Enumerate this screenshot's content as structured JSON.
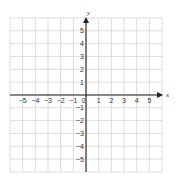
{
  "chart_data": {
    "type": "scatter",
    "title": "",
    "xlabel": "x",
    "ylabel": "y",
    "xlim": [
      -6,
      6
    ],
    "ylim": [
      -6,
      6
    ],
    "grid": true,
    "x_ticks": [
      -5,
      -4,
      -3,
      -2,
      -1,
      0,
      1,
      2,
      3,
      4,
      5
    ],
    "x_tick_labels": [
      "−5",
      "−4",
      "−3",
      "−2",
      "−1",
      "0",
      "1",
      "2",
      "3",
      "4",
      "5"
    ],
    "y_ticks": [
      5,
      4,
      3,
      2,
      1,
      -1,
      -2,
      -3,
      -4,
      -5
    ],
    "y_tick_labels": [
      "5",
      "4",
      "3",
      "2",
      "1",
      "−1",
      "−2",
      "−3",
      "−4",
      "−5"
    ],
    "series": [],
    "legend": null
  },
  "colors": {
    "grid": "#d4d4d4",
    "axis": "#222222",
    "text": "#333333",
    "background": "#ffffff"
  },
  "layout": {
    "grid_left": 10,
    "grid_top": 18,
    "cell_w": 12.67,
    "cell_h": 12.83,
    "cols": 12,
    "rows": 12
  }
}
